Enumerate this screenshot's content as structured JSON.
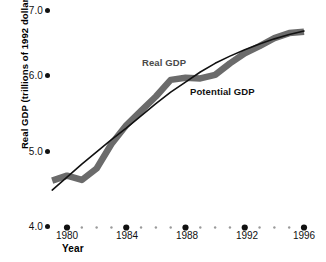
{
  "chart_data": {
    "type": "line",
    "title": "",
    "xlabel": "Year",
    "ylabel": "Real GDP (trillions of 1992 dollars)",
    "xlim": [
      1979,
      1996.6
    ],
    "ylim": [
      4.0,
      7.0
    ],
    "grid": false,
    "legend_position": "inline-annotation",
    "x_tick_labels": [
      "1980",
      "1984",
      "1988",
      "1992",
      "1996"
    ],
    "x_tick_values": [
      1980,
      1984,
      1988,
      1992,
      1996
    ],
    "y_tick_labels": [
      "4.0",
      "5.0",
      "6.0",
      "7.0"
    ],
    "y_tick_values": [
      4.0,
      5.0,
      6.0,
      7.0
    ],
    "x": [
      1979,
      1980,
      1981,
      1982,
      1983,
      1984,
      1985,
      1986,
      1987,
      1988,
      1989,
      1990,
      1991,
      1992,
      1993,
      1994,
      1995,
      1996
    ],
    "series": [
      {
        "name": "Real GDP",
        "color": "#6b6b6b",
        "style": "thick-line",
        "values": [
          4.65,
          4.72,
          4.66,
          4.82,
          5.16,
          5.42,
          5.62,
          5.82,
          6.05,
          6.08,
          6.07,
          6.12,
          6.28,
          6.42,
          6.52,
          6.63,
          6.7,
          6.72
        ]
      },
      {
        "name": "Potential GDP",
        "color": "#111111",
        "style": "thin-line",
        "values": [
          4.52,
          4.7,
          4.88,
          5.05,
          5.22,
          5.38,
          5.55,
          5.72,
          5.88,
          6.02,
          6.16,
          6.28,
          6.38,
          6.47,
          6.55,
          6.62,
          6.68,
          6.73
        ]
      }
    ],
    "annotations": [
      {
        "text": "Real GDP",
        "color": "#4a4a4a"
      },
      {
        "text": "Potential GDP",
        "color": "#111111"
      }
    ]
  },
  "axis": {
    "y_ticks": [
      {
        "label": "7.0"
      },
      {
        "label": "6.0"
      },
      {
        "label": "5.0"
      },
      {
        "label": "4.0"
      }
    ],
    "x_ticks": [
      {
        "label": "1980"
      },
      {
        "label": "1984"
      },
      {
        "label": "1988"
      },
      {
        "label": "1992"
      },
      {
        "label": "1996"
      }
    ],
    "x_title": "Year",
    "y_title": "Real GDP (trillions of 1992 dollars)"
  },
  "labels": {
    "real_gdp": "Real GDP",
    "potential_gdp": "Potential GDP"
  }
}
